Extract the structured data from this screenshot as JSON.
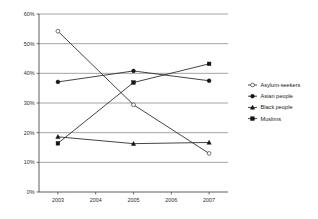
{
  "chart_data": {
    "type": "line",
    "title": "",
    "subtitle": "",
    "xlabel": "",
    "ylabel": "",
    "x": [
      2003,
      2005,
      2007
    ],
    "categories": [
      "2003",
      "2005",
      "2007"
    ],
    "xtick_labels": [
      "2003",
      "2004",
      "2005",
      "2006",
      "2007"
    ],
    "xtick_values": [
      2003,
      2004,
      2005,
      2006,
      2007
    ],
    "xlim": [
      2002.5,
      2007.5
    ],
    "ylim": [
      0,
      60
    ],
    "ytick_labels": [
      "0%",
      "10%",
      "20%",
      "30%",
      "40%",
      "50%",
      "60%"
    ],
    "ytick_values": [
      0,
      10,
      20,
      30,
      40,
      50,
      60
    ],
    "grid": true,
    "grid_axis": "y",
    "legend_position": "right",
    "value_suffix": "%",
    "series": [
      {
        "name": "Asylum-seekers",
        "marker": "open-circle",
        "values": [
          54.2,
          29.4,
          13.0
        ]
      },
      {
        "name": "Asian people",
        "marker": "filled-circle",
        "values": [
          37.1,
          40.8,
          37.5
        ]
      },
      {
        "name": "Black people",
        "marker": "filled-triangle",
        "values": [
          18.6,
          16.3,
          16.7
        ]
      },
      {
        "name": "Muslims",
        "marker": "filled-square",
        "values": [
          16.4,
          36.9,
          43.2
        ]
      }
    ],
    "colors": {
      "line": "#242424",
      "grid": "#8d8d8d",
      "axis": "#4a4a4a",
      "background": "#ffffff",
      "text": "#1a1a1a"
    }
  }
}
